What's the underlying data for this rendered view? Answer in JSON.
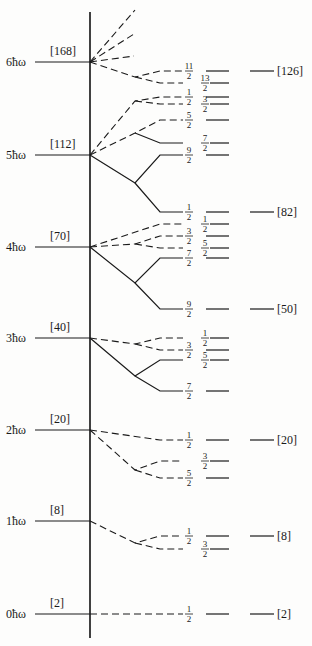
{
  "diagram": {
    "title": "",
    "axis": {
      "x": 90,
      "y_top": 12,
      "y_bottom": 638
    },
    "oscillator_shells": [
      {
        "label": "6ħω",
        "magic": "[168]",
        "y": 62
      },
      {
        "label": "5ħω",
        "magic": "[112]",
        "y": 155
      },
      {
        "label": "4ħω",
        "magic": "[70]",
        "y": 247
      },
      {
        "label": "3ħω",
        "magic": "[40]",
        "y": 338
      },
      {
        "label": "2ħω",
        "magic": "[20]",
        "y": 430
      },
      {
        "label": "1ħω",
        "magic": "[8]",
        "y": 521
      },
      {
        "label": "0ħω",
        "magic": "[2]",
        "y": 614
      }
    ],
    "right_magic_numbers": [
      {
        "label": "[126]",
        "y": 71
      },
      {
        "label": "[82]",
        "y": 212
      },
      {
        "label": "[50]",
        "y": 309
      },
      {
        "label": "[20]",
        "y": 440
      },
      {
        "label": "[8]",
        "y": 536
      },
      {
        "label": "[2]",
        "y": 614
      }
    ],
    "levels": [
      {
        "j": "11/2",
        "y": 71,
        "frac_x": 189,
        "col": 1
      },
      {
        "j": "13/2",
        "y": 83,
        "frac_x": 205,
        "col": 2
      },
      {
        "j": "1/2",
        "y": 97,
        "frac_x": 189,
        "col": 1
      },
      {
        "j": "3/2",
        "y": 104,
        "frac_x": 205,
        "col": 2
      },
      {
        "j": "5/2",
        "y": 120,
        "frac_x": 189,
        "col": 1
      },
      {
        "j": "7/2",
        "y": 143,
        "frac_x": 205,
        "col": 2
      },
      {
        "j": "9/2",
        "y": 155,
        "frac_x": 189,
        "col": 1
      },
      {
        "j": "1/2",
        "y": 212,
        "frac_x": 189,
        "col": 1
      },
      {
        "j": "1/2",
        "y": 224,
        "frac_x": 205,
        "col": 2
      },
      {
        "j": "3/2",
        "y": 236,
        "frac_x": 189,
        "col": 1
      },
      {
        "j": "5/2",
        "y": 248,
        "frac_x": 205,
        "col": 2
      },
      {
        "j": "7/2",
        "y": 258,
        "frac_x": 189,
        "col": 1
      },
      {
        "j": "9/2",
        "y": 309,
        "frac_x": 189,
        "col": 1
      },
      {
        "j": "1/2",
        "y": 338,
        "frac_x": 205,
        "col": 2
      },
      {
        "j": "3/2",
        "y": 350,
        "frac_x": 189,
        "col": 1
      },
      {
        "j": "5/2",
        "y": 360,
        "frac_x": 205,
        "col": 2
      },
      {
        "j": "7/2",
        "y": 391,
        "frac_x": 189,
        "col": 1
      },
      {
        "j": "1/2",
        "y": 440,
        "frac_x": 189,
        "col": 1
      },
      {
        "j": "3/2",
        "y": 461,
        "frac_x": 205,
        "col": 2
      },
      {
        "j": "5/2",
        "y": 478,
        "frac_x": 189,
        "col": 1
      },
      {
        "j": "1/2",
        "y": 536,
        "frac_x": 189,
        "col": 1
      },
      {
        "j": "3/2",
        "y": 549,
        "frac_x": 205,
        "col": 2
      },
      {
        "j": "1/2",
        "y": 614,
        "frac_x": 189,
        "col": 1
      }
    ],
    "branches": [
      {
        "style": "dash",
        "points": [
          [
            90,
            62
          ],
          [
            135,
            10
          ]
        ]
      },
      {
        "style": "dash",
        "points": [
          [
            90,
            62
          ],
          [
            134,
            34
          ]
        ]
      },
      {
        "style": "dash",
        "points": [
          [
            90,
            62
          ],
          [
            134,
            56
          ]
        ]
      },
      {
        "style": "dash",
        "points": [
          [
            90,
            62
          ],
          [
            135,
            77
          ],
          [
            160,
            71
          ],
          [
            183,
            71
          ]
        ]
      },
      {
        "style": "dash",
        "points": [
          [
            135,
            77
          ],
          [
            160,
            83
          ],
          [
            183,
            83
          ]
        ]
      },
      {
        "style": "dash",
        "points": [
          [
            90,
            155
          ],
          [
            135,
            101
          ],
          [
            160,
            97
          ],
          [
            183,
            97
          ]
        ]
      },
      {
        "style": "dash",
        "points": [
          [
            135,
            101
          ],
          [
            160,
            104
          ],
          [
            183,
            104
          ]
        ]
      },
      {
        "style": "dash",
        "points": [
          [
            90,
            155
          ],
          [
            135,
            133
          ],
          [
            160,
            120
          ],
          [
            183,
            120
          ]
        ]
      },
      {
        "style": "line",
        "points": [
          [
            135,
            133
          ],
          [
            160,
            143
          ],
          [
            183,
            143
          ]
        ]
      },
      {
        "style": "line",
        "points": [
          [
            90,
            155
          ],
          [
            135,
            183
          ],
          [
            160,
            155
          ],
          [
            183,
            155
          ]
        ]
      },
      {
        "style": "line",
        "points": [
          [
            135,
            183
          ],
          [
            160,
            212
          ],
          [
            183,
            212
          ]
        ]
      },
      {
        "style": "dash",
        "points": [
          [
            90,
            247
          ],
          [
            160,
            224
          ],
          [
            183,
            224
          ]
        ]
      },
      {
        "style": "dash",
        "points": [
          [
            90,
            247
          ],
          [
            135,
            244
          ],
          [
            160,
            236
          ],
          [
            183,
            236
          ]
        ]
      },
      {
        "style": "dash",
        "points": [
          [
            135,
            244
          ],
          [
            160,
            248
          ],
          [
            183,
            248
          ]
        ]
      },
      {
        "style": "line",
        "points": [
          [
            90,
            247
          ],
          [
            135,
            283
          ],
          [
            160,
            258
          ],
          [
            183,
            258
          ]
        ]
      },
      {
        "style": "line",
        "points": [
          [
            135,
            283
          ],
          [
            160,
            309
          ],
          [
            183,
            309
          ]
        ]
      },
      {
        "style": "dash",
        "points": [
          [
            90,
            338
          ],
          [
            135,
            344
          ],
          [
            160,
            338
          ],
          [
            183,
            338
          ]
        ]
      },
      {
        "style": "dash",
        "points": [
          [
            135,
            344
          ],
          [
            160,
            350
          ],
          [
            183,
            350
          ]
        ]
      },
      {
        "style": "line",
        "points": [
          [
            90,
            338
          ],
          [
            135,
            376
          ],
          [
            160,
            360
          ],
          [
            183,
            360
          ]
        ]
      },
      {
        "style": "line",
        "points": [
          [
            135,
            376
          ],
          [
            160,
            391
          ],
          [
            183,
            391
          ]
        ]
      },
      {
        "style": "dash",
        "points": [
          [
            90,
            430
          ],
          [
            160,
            440
          ],
          [
            183,
            440
          ]
        ]
      },
      {
        "style": "dash",
        "points": [
          [
            90,
            430
          ],
          [
            135,
            470
          ],
          [
            160,
            461
          ],
          [
            183,
            461
          ]
        ]
      },
      {
        "style": "dash",
        "points": [
          [
            135,
            470
          ],
          [
            160,
            478
          ],
          [
            183,
            478
          ]
        ]
      },
      {
        "style": "dash",
        "points": [
          [
            90,
            521
          ],
          [
            135,
            543
          ],
          [
            160,
            536
          ],
          [
            183,
            536
          ]
        ]
      },
      {
        "style": "dash",
        "points": [
          [
            135,
            543
          ],
          [
            160,
            549
          ],
          [
            183,
            549
          ]
        ]
      },
      {
        "style": "dash",
        "points": [
          [
            90,
            614
          ],
          [
            183,
            614
          ]
        ]
      }
    ]
  }
}
